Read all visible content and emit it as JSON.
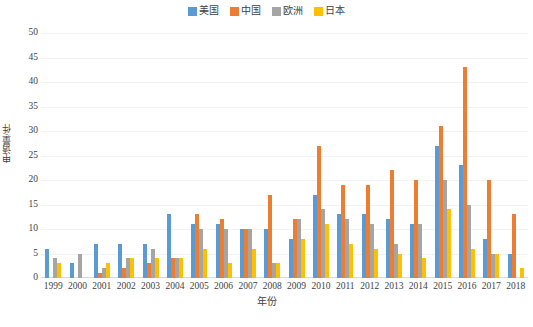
{
  "legend": {
    "position": "top-center",
    "items": [
      {
        "label": "美国",
        "color": "#5B9BD5",
        "swatch_name": "legend-swatch-usa"
      },
      {
        "label": "中国",
        "color": "#ED7D31",
        "swatch_name": "legend-swatch-china"
      },
      {
        "label": "欧洲",
        "color": "#A5A5A5",
        "swatch_name": "legend-swatch-europe"
      },
      {
        "label": "日本",
        "color": "#FFC000",
        "swatch_name": "legend-swatch-japan"
      }
    ]
  },
  "axes": {
    "y_title": "申请量/件",
    "x_title": "年份",
    "y_ticks": [
      "0",
      "5",
      "10",
      "15",
      "20",
      "25",
      "30",
      "35",
      "40",
      "45",
      "50"
    ]
  },
  "caption": "",
  "chart_data": {
    "type": "bar",
    "title": "",
    "subtitle": "",
    "xlabel": "年份",
    "ylabel": "申请量/件",
    "ylim": [
      0,
      50
    ],
    "ytick_step": 5,
    "grid": true,
    "legend_position": "top-center",
    "categories": [
      "1999",
      "2000",
      "2001",
      "2002",
      "2003",
      "2004",
      "2005",
      "2006",
      "2007",
      "2008",
      "2009",
      "2010",
      "2011",
      "2012",
      "2013",
      "2014",
      "2015",
      "2016",
      "2017",
      "2018"
    ],
    "series": [
      {
        "name": "美国",
        "color": "#5B9BD5",
        "values": [
          6,
          3,
          7,
          7,
          7,
          13,
          11,
          11,
          10,
          10,
          8,
          17,
          13,
          13,
          12,
          11,
          27,
          23,
          8,
          5
        ]
      },
      {
        "name": "中国",
        "color": "#ED7D31",
        "values": [
          0,
          0,
          1,
          2,
          3,
          4,
          13,
          12,
          10,
          17,
          12,
          27,
          19,
          19,
          22,
          20,
          31,
          43,
          20,
          13
        ]
      },
      {
        "name": "欧洲",
        "color": "#A5A5A5",
        "values": [
          4,
          5,
          2,
          4,
          6,
          4,
          10,
          10,
          10,
          3,
          12,
          14,
          12,
          11,
          7,
          11,
          20,
          15,
          5,
          0
        ]
      },
      {
        "name": "日本",
        "color": "#FFC000",
        "values": [
          3,
          0,
          3,
          4,
          4,
          4,
          6,
          3,
          6,
          3,
          8,
          11,
          7,
          6,
          5,
          4,
          14,
          6,
          5,
          2
        ]
      }
    ]
  }
}
